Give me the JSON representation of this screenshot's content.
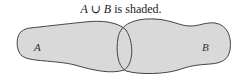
{
  "caption": {
    "set_a": "A",
    "union_symbol": "∪",
    "set_b": "B",
    "suffix": " is shaded."
  },
  "diagram": {
    "type": "venn",
    "operation": "union",
    "regions": [
      {
        "label": "A",
        "shaded": true
      },
      {
        "label": "B",
        "shaded": true
      }
    ],
    "fill_color": "#d9d9d9",
    "stroke_color": "#444444"
  }
}
